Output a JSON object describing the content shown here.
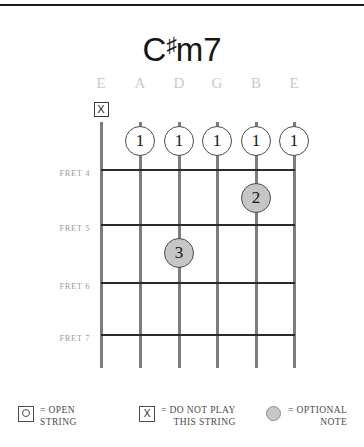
{
  "title": {
    "root": "C",
    "accidental": "♯",
    "quality": "m7",
    "full": "C♯m7"
  },
  "strings": {
    "labels": [
      "E",
      "A",
      "D",
      "G",
      "B",
      "E"
    ],
    "count": 6
  },
  "frets": {
    "labels": [
      "FRET 4",
      "FRET 5",
      "FRET 6",
      "FRET 7"
    ],
    "numbers": [
      4,
      5,
      6,
      7
    ]
  },
  "markers": [
    {
      "id": "mute-low-e",
      "type": "mute",
      "symbol": "X",
      "string": 1,
      "fret": "above-nut"
    },
    {
      "id": "barre-a-4",
      "type": "finger",
      "finger": "1",
      "string": 2,
      "fret": 4,
      "fill": "open"
    },
    {
      "id": "barre-d-4",
      "type": "finger",
      "finger": "1",
      "string": 3,
      "fret": 4,
      "fill": "open"
    },
    {
      "id": "barre-g-4",
      "type": "finger",
      "finger": "1",
      "string": 4,
      "fret": 4,
      "fill": "open"
    },
    {
      "id": "barre-b-4",
      "type": "finger",
      "finger": "1",
      "string": 5,
      "fret": 4,
      "fill": "open"
    },
    {
      "id": "barre-high-e-4",
      "type": "finger",
      "finger": "1",
      "string": 6,
      "fret": 4,
      "fill": "open"
    },
    {
      "id": "optional-b-5",
      "type": "finger",
      "finger": "2",
      "string": 5,
      "fret": 5,
      "fill": "optional"
    },
    {
      "id": "optional-d-6",
      "type": "finger",
      "finger": "3",
      "string": 3,
      "fret": 6,
      "fill": "optional"
    }
  ],
  "legend": [
    {
      "id": "open-string",
      "glyph": "boxed-circle",
      "glyph_char": "○",
      "line1": "= OPEN",
      "line2": "STRING"
    },
    {
      "id": "do-not-play",
      "glyph": "boxed-x",
      "glyph_char": "X",
      "line1": "= DO NOT PLAY",
      "line2": "THIS STRING"
    },
    {
      "id": "optional-note",
      "glyph": "gray-dot",
      "glyph_char": "●",
      "line1": "= OPTIONAL",
      "line2": "NOTE"
    }
  ],
  "colors": {
    "string": "#7d7d80",
    "fret_line": "#2b2b2b",
    "string_label": "#c9c9cc",
    "fret_label": "#9b9b9e",
    "marker_border": "#4a4a4a",
    "optional_fill": "#c6c6c6",
    "text": "#231f20"
  }
}
